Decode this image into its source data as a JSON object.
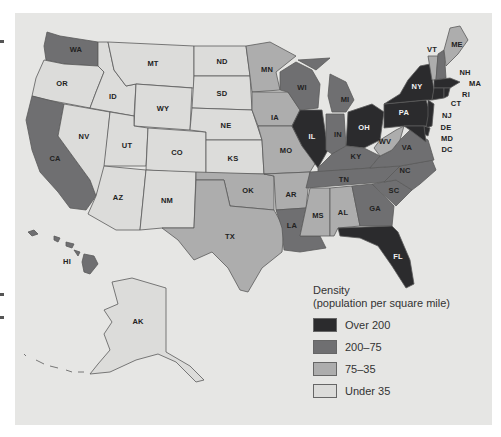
{
  "colors": {
    "background": "#e6e6e4",
    "over_200": "#2b2b2d",
    "200_75": "#6f6f71",
    "75_35": "#adadad",
    "under_35": "#dcdcda"
  },
  "legend": {
    "title_line1": "Density",
    "title_line2": "(population per square mile)",
    "items": [
      {
        "label": "Over 200",
        "key": "over_200"
      },
      {
        "label": "200–75",
        "key": "200_75"
      },
      {
        "label": "75–35",
        "key": "75_35"
      },
      {
        "label": "Under 35",
        "key": "under_35"
      }
    ]
  },
  "states": {
    "WA": {
      "label": "WA",
      "category": "200_75"
    },
    "OR": {
      "label": "OR",
      "category": "under_35"
    },
    "CA": {
      "label": "CA",
      "category": "200_75"
    },
    "NV": {
      "label": "NV",
      "category": "under_35"
    },
    "ID": {
      "label": "ID",
      "category": "under_35"
    },
    "MT": {
      "label": "MT",
      "category": "under_35"
    },
    "WY": {
      "label": "WY",
      "category": "under_35"
    },
    "UT": {
      "label": "UT",
      "category": "under_35"
    },
    "AZ": {
      "label": "AZ",
      "category": "under_35"
    },
    "CO": {
      "label": "CO",
      "category": "under_35"
    },
    "NM": {
      "label": "NM",
      "category": "under_35"
    },
    "ND": {
      "label": "ND",
      "category": "under_35"
    },
    "SD": {
      "label": "SD",
      "category": "under_35"
    },
    "NE": {
      "label": "NE",
      "category": "under_35"
    },
    "KS": {
      "label": "KS",
      "category": "under_35"
    },
    "OK": {
      "label": "OK",
      "category": "75_35"
    },
    "TX": {
      "label": "TX",
      "category": "75_35"
    },
    "MN": {
      "label": "MN",
      "category": "75_35"
    },
    "IA": {
      "label": "IA",
      "category": "75_35"
    },
    "MO": {
      "label": "MO",
      "category": "75_35"
    },
    "AR": {
      "label": "AR",
      "category": "75_35"
    },
    "LA": {
      "label": "LA",
      "category": "200_75"
    },
    "WI": {
      "label": "WI",
      "category": "200_75"
    },
    "IL": {
      "label": "IL",
      "category": "over_200"
    },
    "MI": {
      "label": "MI",
      "category": "200_75"
    },
    "IN": {
      "label": "IN",
      "category": "200_75"
    },
    "OH": {
      "label": "OH",
      "category": "over_200"
    },
    "KY": {
      "label": "KY",
      "category": "200_75"
    },
    "TN": {
      "label": "TN",
      "category": "200_75"
    },
    "MS": {
      "label": "MS",
      "category": "75_35"
    },
    "AL": {
      "label": "AL",
      "category": "75_35"
    },
    "GA": {
      "label": "GA",
      "category": "200_75"
    },
    "FL": {
      "label": "FL",
      "category": "over_200"
    },
    "SC": {
      "label": "SC",
      "category": "200_75"
    },
    "NC": {
      "label": "NC",
      "category": "200_75"
    },
    "VA": {
      "label": "VA",
      "category": "200_75"
    },
    "WV": {
      "label": "WV",
      "category": "75_35"
    },
    "PA": {
      "label": "PA",
      "category": "over_200"
    },
    "NY": {
      "label": "NY",
      "category": "over_200"
    },
    "VT": {
      "label": "VT",
      "category": "75_35"
    },
    "NH": {
      "label": "NH",
      "category": "200_75"
    },
    "ME": {
      "label": "ME",
      "category": "75_35"
    },
    "MA": {
      "label": "MA",
      "category": "over_200"
    },
    "RI": {
      "label": "RI",
      "category": "over_200"
    },
    "CT": {
      "label": "CT",
      "category": "over_200"
    },
    "NJ": {
      "label": "NJ",
      "category": "over_200"
    },
    "DE": {
      "label": "DE",
      "category": "over_200"
    },
    "MD": {
      "label": "MD",
      "category": "over_200"
    },
    "DC": {
      "label": "DC",
      "category": "over_200"
    },
    "AK": {
      "label": "AK",
      "category": "under_35"
    },
    "HI": {
      "label": "HI",
      "category": "200_75"
    }
  }
}
